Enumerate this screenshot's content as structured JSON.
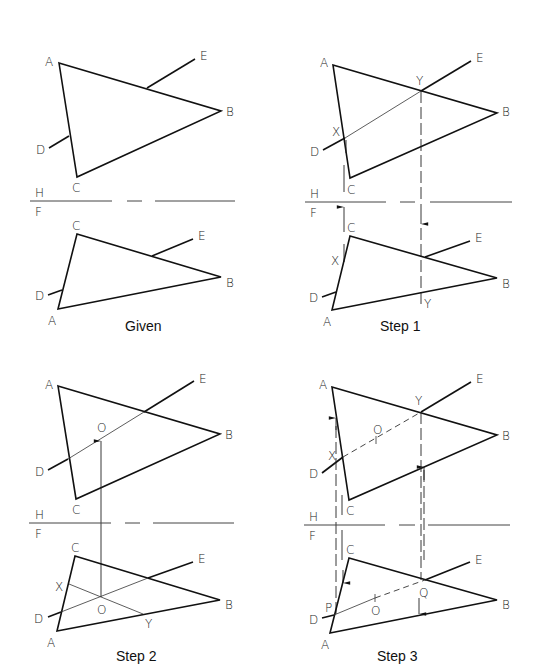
{
  "figure": {
    "panels": [
      {
        "caption": "Given",
        "fold_labels": {
          "top": "H",
          "bottom": "F"
        },
        "top_view_labels": {
          "A": "A",
          "B": "B",
          "C": "C",
          "D": "D",
          "E": "E"
        },
        "front_view_labels": {
          "A": "A",
          "B": "B",
          "C": "C",
          "D": "D",
          "E": "E"
        }
      },
      {
        "caption": "Step 1",
        "fold_labels": {
          "top": "H",
          "bottom": "F"
        },
        "top_view_labels": {
          "A": "A",
          "B": "B",
          "C": "C",
          "D": "D",
          "E": "E",
          "X": "X",
          "Y": "Y"
        },
        "front_view_labels": {
          "A": "A",
          "B": "B",
          "C": "C",
          "D": "D",
          "E": "E",
          "X": "X",
          "Y": "Y"
        }
      },
      {
        "caption": "Step 2",
        "fold_labels": {
          "top": "H",
          "bottom": "F"
        },
        "top_view_labels": {
          "A": "A",
          "B": "B",
          "C": "C",
          "D": "D",
          "E": "E",
          "O": "O"
        },
        "front_view_labels": {
          "A": "A",
          "B": "B",
          "C": "C",
          "D": "D",
          "E": "E",
          "X": "X",
          "Y": "Y",
          "O": "O"
        }
      },
      {
        "caption": "Step 3",
        "fold_labels": {
          "top": "H",
          "bottom": "F"
        },
        "top_view_labels": {
          "A": "A",
          "B": "B",
          "C": "C",
          "D": "D",
          "E": "E",
          "X": "X",
          "Y": "Y",
          "O": "O"
        },
        "front_view_labels": {
          "A": "A",
          "B": "B",
          "C": "C",
          "D": "D",
          "E": "E",
          "P": "P",
          "Q": "Q",
          "O": "O"
        }
      }
    ]
  }
}
